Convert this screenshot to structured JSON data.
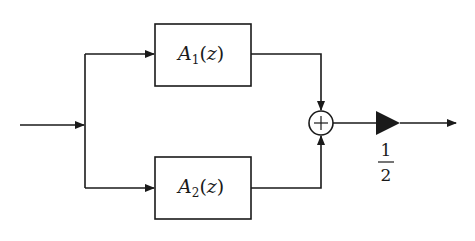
{
  "diagram": {
    "type": "block-diagram",
    "blocks": [
      {
        "id": "A1",
        "name": "A",
        "subscript": "1",
        "arg": "(z)",
        "open_paren": "(",
        "var": "z",
        "close_paren": ")"
      },
      {
        "id": "A2",
        "name": "A",
        "subscript": "2",
        "arg": "(z)",
        "open_paren": "(",
        "var": "z",
        "close_paren": ")"
      }
    ],
    "summer": {
      "symbol": "+"
    },
    "gain": {
      "numerator": "1",
      "denominator": "2"
    },
    "colors": {
      "stroke": "#1a1a1a",
      "background": "#ffffff"
    }
  }
}
